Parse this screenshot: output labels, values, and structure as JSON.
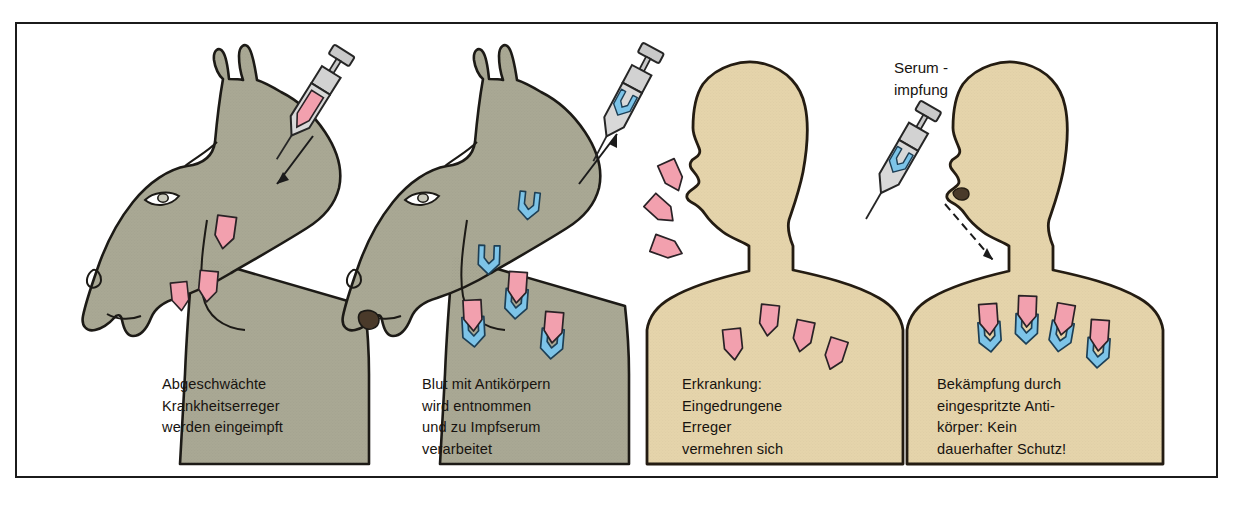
{
  "figure": {
    "border_color": "#1b1b1b",
    "background": "#ffffff"
  },
  "colors": {
    "horse_body": "#a9a894",
    "horse_outline": "#1c1a16",
    "human_skin": "#e5d4ab",
    "human_outline": "#241c12",
    "pathogen_pink": "#f2a0ae",
    "pathogen_outline": "#2a2226",
    "antibody_blue": "#7dc4e8",
    "antibody_outline": "#1d3f55",
    "syringe_gray": "#c9c9c9",
    "syringe_outline": "#262626",
    "text": "#17130f"
  },
  "panels": [
    {
      "id": "panel-horse-1",
      "subject": "horse",
      "caption_lines": [
        "Abgeschwächte",
        "Krankheitserreger",
        "werden eingeimpft"
      ],
      "pathogen_count": 3,
      "antibody_count": 0,
      "syringe": {
        "present": true,
        "content": "pathogen",
        "direction": "into-animal"
      }
    },
    {
      "id": "panel-horse-2",
      "subject": "horse",
      "caption_lines": [
        "Blut mit Antikörpern",
        "wird entnommen",
        "und zu Impfserum",
        "verarbeitet"
      ],
      "pathogen_count": 3,
      "antibody_count": 5,
      "syringe": {
        "present": true,
        "content": "antibody",
        "direction": "out-of-animal"
      }
    },
    {
      "id": "panel-human-1",
      "subject": "human",
      "caption_lines": [
        "Erkrankung:",
        "Eingedrungene",
        "Erreger",
        "vermehren sich"
      ],
      "pathogen_count": 7,
      "antibody_count": 0,
      "syringe": {
        "present": false,
        "content": "",
        "direction": ""
      }
    },
    {
      "id": "panel-human-2",
      "subject": "human",
      "caption_lines": [
        "Bekämpfung durch",
        "eingespritzte Anti-",
        "körper: Kein",
        "dauerhafter Schutz!"
      ],
      "pathogen_count": 4,
      "antibody_count": 4,
      "syringe": {
        "present": true,
        "content": "antibody",
        "direction": "into-human"
      }
    }
  ],
  "captions": {
    "panel1": "Abgeschwächte\nKrankheitserreger\nwerden eingeimpft",
    "panel2": "Blut mit Antikörpern\nwird entnommen\nund zu Impfserum\nverarbeitet",
    "panel3": "Erkrankung:\nEingedrungene\nErreger\nvermehren sich",
    "panel4": "Bekämpfung durch\neingespritzte Anti-\nkörper: Kein\ndauerhafter Schutz!"
  },
  "annotations": {
    "serum_label": "Serum -\nimpfung"
  },
  "footnote": {
    "text": ""
  }
}
